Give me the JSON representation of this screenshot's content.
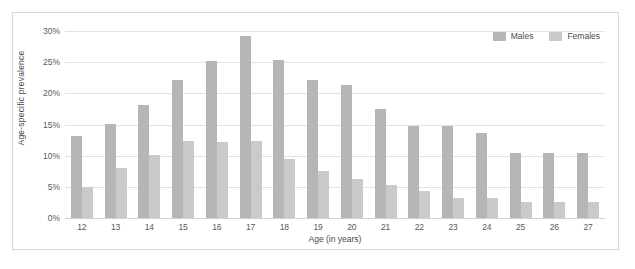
{
  "chart_data": {
    "type": "bar",
    "title": "",
    "xlabel": "Age (in years)",
    "ylabel": "Age-specific prevalence",
    "categories": [
      "12",
      "13",
      "14",
      "15",
      "16",
      "17",
      "18",
      "19",
      "20",
      "21",
      "22",
      "23",
      "24",
      "25",
      "26",
      "27"
    ],
    "series": [
      {
        "name": "Males",
        "color": "#b6b6b6",
        "values": [
          13.2,
          15.1,
          18.2,
          22.1,
          25.2,
          29.2,
          25.3,
          22.2,
          21.3,
          17.5,
          14.8,
          14.8,
          13.6,
          10.5,
          10.5,
          10.5
        ]
      },
      {
        "name": "Females",
        "color": "#cacaca",
        "values": [
          5.0,
          8.0,
          10.1,
          12.3,
          12.2,
          12.3,
          9.4,
          7.6,
          6.3,
          5.3,
          4.4,
          3.2,
          3.2,
          2.5,
          2.5,
          2.5
        ]
      }
    ],
    "ylim": [
      0,
      30
    ],
    "yticks": [
      0,
      5,
      10,
      15,
      20,
      25,
      30
    ],
    "ytick_labels": [
      "0%",
      "5%",
      "10%",
      "15%",
      "20%",
      "25%",
      "30%"
    ],
    "grid": true,
    "legend_position": "top-right",
    "legend": [
      "Males",
      "Females"
    ]
  },
  "legend": {
    "entries": [
      {
        "label": "Males"
      },
      {
        "label": "Females"
      }
    ]
  }
}
